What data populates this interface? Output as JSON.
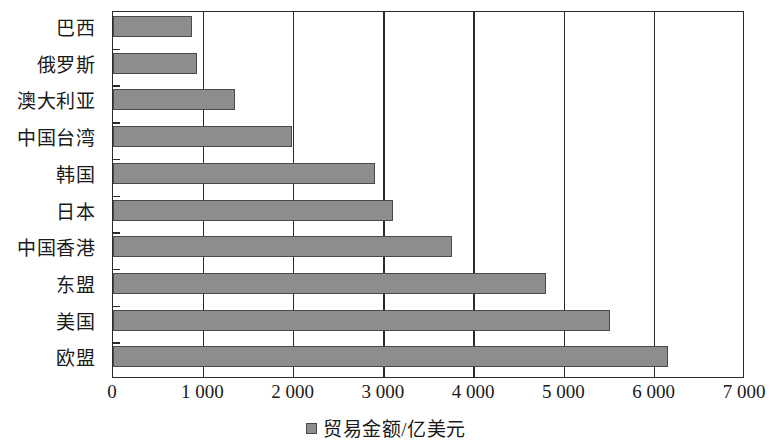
{
  "chart_data": {
    "type": "bar",
    "orientation": "horizontal",
    "title": "",
    "xlabel": "",
    "ylabel": "",
    "categories": [
      "巴西",
      "俄罗斯",
      "澳大利亚",
      "中国台湾",
      "韩国",
      "日本",
      "中国香港",
      "东盟",
      "美国",
      "欧盟"
    ],
    "values": [
      870,
      930,
      1350,
      1980,
      2900,
      3100,
      3750,
      4800,
      5500,
      6150
    ],
    "series": [
      {
        "name": "贸易金额/亿美元",
        "values": [
          870,
          930,
          1350,
          1980,
          2900,
          3100,
          3750,
          4800,
          5500,
          6150
        ]
      }
    ],
    "xlim": [
      0,
      7000
    ],
    "xticks": [
      0,
      1000,
      2000,
      3000,
      4000,
      5000,
      6000,
      7000
    ],
    "xtick_labels": [
      "0",
      "1 000",
      "2 000",
      "3 000",
      "4 000",
      "5 000",
      "6 000",
      "7 000"
    ],
    "grid": true,
    "grid_axis": "x",
    "legend": {
      "position": "bottom",
      "entries": [
        {
          "label": "贸易金额/亿美元",
          "color": "#8d8d8d"
        }
      ]
    },
    "colors": {
      "bar_fill": "#8d8d8d",
      "bar_border": "#4a4a4a",
      "axis": "#2b2b2b",
      "text": "#1a1a1a",
      "background": "#ffffff"
    }
  }
}
